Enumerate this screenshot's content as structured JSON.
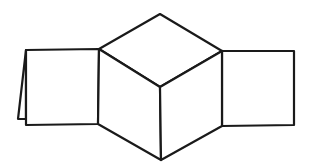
{
  "diagram": {
    "stroke_color": "#1a1a1a",
    "background": "#ffffff",
    "points": {
      "top_apex": [
        160,
        14
      ],
      "hex_upper_left": [
        99,
        49
      ],
      "hex_upper_right": [
        222,
        51
      ],
      "center": [
        160,
        87
      ],
      "hex_lower_left": [
        98,
        124
      ],
      "hex_lower_right": [
        222,
        126
      ],
      "bottom_apex": [
        161,
        160
      ]
    },
    "shapes": [
      {
        "name": "cube-top-face",
        "points": "160,14 222,51 160,87 99,49"
      },
      {
        "name": "cube-left-face",
        "points": "99,49 160,87 161,160 98,124"
      },
      {
        "name": "cube-right-face",
        "points": "160,87 222,51 222,126 161,160"
      },
      {
        "name": "left-square-face",
        "points": "26,50 99,49 98,124 26,125"
      },
      {
        "name": "left-fold-flap",
        "points": "26,50 18,119 26,119"
      },
      {
        "name": "right-square-face",
        "points": "222,51 294,51 294,125 222,126"
      }
    ]
  }
}
